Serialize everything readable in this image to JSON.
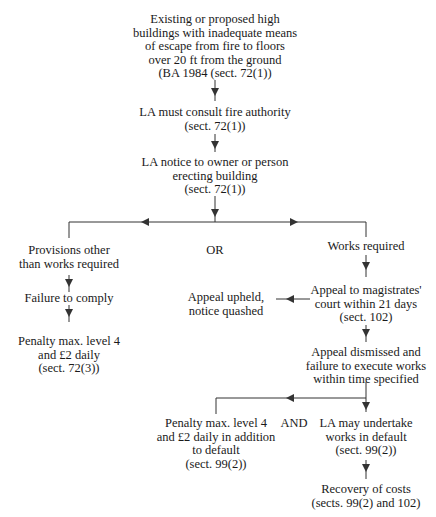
{
  "diagram": {
    "type": "flowchart",
    "nodes": {
      "start": {
        "lines": [
          "Existing or proposed high",
          "buildings with inadequate means",
          "of escape from fire to floors",
          "over 20 ft from the ground",
          "(BA 1984 (sect. 72(1))"
        ]
      },
      "consult": {
        "lines": [
          "LA must consult fire authority",
          "(sect. 72(1))"
        ]
      },
      "notice": {
        "lines": [
          "LA notice to owner or person",
          "erecting building",
          "(sect. 72(1))"
        ]
      },
      "provisions": {
        "lines": [
          "Provisions other",
          "than works required"
        ]
      },
      "or_label": {
        "text": "OR"
      },
      "works_required": {
        "lines": [
          "Works required"
        ]
      },
      "failure_comply": {
        "lines": [
          "Failure to comply"
        ]
      },
      "penalty_left": {
        "lines": [
          "Penalty max. level 4",
          "and £2 daily",
          "(sect. 72(3))"
        ]
      },
      "appeal_upheld": {
        "lines": [
          "Appeal upheld,",
          "notice quashed"
        ]
      },
      "appeal_court": {
        "lines": [
          "Appeal to magistrates'",
          "court within 21 days",
          "(sect. 102)"
        ]
      },
      "appeal_dismissed": {
        "lines": [
          "Appeal dismissed and",
          "failure to execute works",
          "within time specified"
        ]
      },
      "penalty_default": {
        "lines": [
          "Penalty max. level 4",
          "and £2 daily in addition",
          "to default",
          "(sect. 99(2))"
        ]
      },
      "and_label": {
        "text": "AND"
      },
      "la_undertake": {
        "lines": [
          "LA may undertake",
          "works in default",
          "(sect. 99(2))"
        ]
      },
      "recovery": {
        "lines": [
          "Recovery of costs",
          "(sects. 99(2) and 102)"
        ]
      }
    },
    "edges": [
      {
        "from": "start",
        "to": "consult"
      },
      {
        "from": "consult",
        "to": "notice"
      },
      {
        "from": "notice",
        "to": "provisions"
      },
      {
        "from": "notice",
        "to": "works_required"
      },
      {
        "from": "provisions",
        "to": "failure_comply"
      },
      {
        "from": "failure_comply",
        "to": "penalty_left"
      },
      {
        "from": "works_required",
        "to": "appeal_court"
      },
      {
        "from": "appeal_court",
        "to": "appeal_upheld"
      },
      {
        "from": "appeal_court",
        "to": "appeal_dismissed"
      },
      {
        "from": "appeal_dismissed",
        "to": "penalty_default"
      },
      {
        "from": "appeal_dismissed",
        "to": "la_undertake"
      },
      {
        "from": "la_undertake",
        "to": "recovery"
      }
    ],
    "colors": {
      "line": "#333333",
      "text": "#1a1a1a",
      "background": "#ffffff"
    }
  }
}
